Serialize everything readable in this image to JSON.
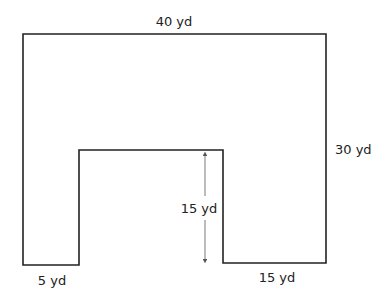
{
  "diagram": {
    "type": "composite-shape",
    "colors": {
      "stroke": "#222222",
      "arrow": "#555555",
      "background": "#ffffff"
    },
    "labels": {
      "top_width": "40 yd",
      "right_height": "30 yd",
      "notch_height": "15 yd",
      "bottom_left_width": "5 yd",
      "bottom_right_width": "15 yd"
    }
  }
}
